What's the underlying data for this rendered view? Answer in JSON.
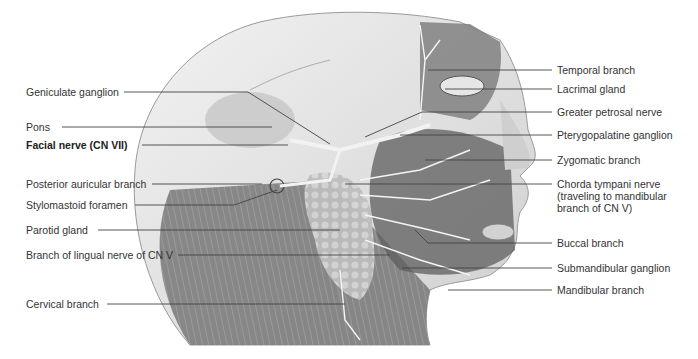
{
  "figure": {
    "labels_left": [
      {
        "id": "geniculate-ganglion",
        "text": "Geniculate ganglion",
        "x": 26,
        "y": 86,
        "bold": false
      },
      {
        "id": "pons",
        "text": "Pons",
        "x": 26,
        "y": 121,
        "bold": false
      },
      {
        "id": "facial-nerve",
        "text": "Facial nerve (CN VII)",
        "x": 26,
        "y": 139,
        "bold": true
      },
      {
        "id": "posterior-auricular-branch",
        "text": "Posterior auricular branch",
        "x": 26,
        "y": 178,
        "bold": false
      },
      {
        "id": "stylomastoid-foramen",
        "text": "Stylomastoid foramen",
        "x": 26,
        "y": 199,
        "bold": false
      },
      {
        "id": "parotid-gland",
        "text": "Parotid gland",
        "x": 26,
        "y": 224,
        "bold": false
      },
      {
        "id": "branch-lingual-nerve",
        "text": "Branch of lingual nerve of CN V",
        "x": 26,
        "y": 250,
        "bold": false
      },
      {
        "id": "cervical-branch",
        "text": "Cervical branch",
        "x": 26,
        "y": 298,
        "bold": false
      }
    ],
    "labels_right": [
      {
        "id": "temporal-branch",
        "text": "Temporal branch",
        "x": 557,
        "y": 64
      },
      {
        "id": "lacrimal-gland",
        "text": "Lacrimal gland",
        "x": 557,
        "y": 83
      },
      {
        "id": "greater-petrosal-nerve",
        "text": "Greater petrosal nerve",
        "x": 557,
        "y": 105
      },
      {
        "id": "pterygopalatine-ganglion",
        "text": "Pterygopalatine ganglion",
        "x": 557,
        "y": 130
      },
      {
        "id": "zygomatic-branch",
        "text": "Zygomatic branch",
        "x": 557,
        "y": 154
      },
      {
        "id": "chorda-tympani-nerve",
        "text": "Chorda tympani nerve\n(traveling to mandibular\nbranch of CN V)",
        "x": 557,
        "y": 178
      },
      {
        "id": "buccal-branch",
        "text": "Buccal branch",
        "x": 557,
        "y": 237
      },
      {
        "id": "submandibular-ganglion",
        "text": "Submandibular ganglion",
        "x": 557,
        "y": 262
      },
      {
        "id": "mandibular-branch",
        "text": "Mandibular branch",
        "x": 557,
        "y": 286
      }
    ],
    "colors": {
      "background": "#ffffff",
      "leader_line": "#444444",
      "skin": "#d9d9d9",
      "muscle": "#8a8a8a",
      "gland": "#c4c4c4",
      "nerve": "#f0f0f0"
    }
  }
}
